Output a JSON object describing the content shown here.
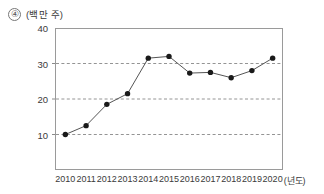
{
  "figure": {
    "number_marker": "④",
    "unit_label": "(백만 주)"
  },
  "chart_data": {
    "type": "line",
    "title": "",
    "subtitle": "",
    "xlabel": "(년도)",
    "ylabel": "(백만 주)",
    "categories": [
      "2010",
      "2011",
      "2012",
      "2013",
      "2014",
      "2015",
      "2016",
      "2017",
      "2018",
      "2019",
      "2020"
    ],
    "values": [
      10,
      12.5,
      18.5,
      21.5,
      31.5,
      32,
      27.3,
      27.5,
      26,
      28,
      31.5
    ],
    "series": [
      {
        "name": "거래량",
        "values": [
          10,
          12.5,
          18.5,
          21.5,
          31.5,
          32,
          27.3,
          27.5,
          26,
          28,
          31.5
        ]
      }
    ],
    "ylim": [
      0,
      40
    ],
    "yticks": [
      10,
      20,
      30,
      40
    ],
    "ytick_labels": [
      "10",
      "20",
      "30",
      "40"
    ],
    "xtick_labels": [
      "2010",
      "2011",
      "2012",
      "2013",
      "2014",
      "2015",
      "2016",
      "2017",
      "2018",
      "2019",
      "2020"
    ],
    "grid": "horizontal-dashed",
    "gridlines": [
      10,
      20,
      30
    ],
    "legend": "none",
    "marker": "filled-circle",
    "marker_color": "#1a1a1a",
    "line_color": "#555555",
    "grid_color": "#888888",
    "frame_color": "#9a9a9a",
    "annotations": []
  },
  "colors": {
    "background": "#ffffff",
    "text": "#3a3a3a",
    "accent": "#1a1a1a"
  }
}
